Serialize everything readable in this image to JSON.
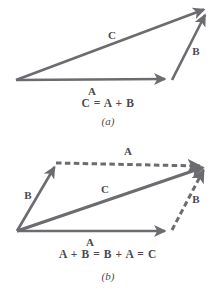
{
  "figure": {
    "stroke_color": "#6b6b70",
    "text_color": "#4a4a4f",
    "background_color": "#ffffff",
    "panels": [
      {
        "id": "panel-a",
        "caption": "(a)",
        "style": "triangle-rule",
        "equation": "C = A + B",
        "vectors": [
          {
            "name": "A",
            "label": "A",
            "line_style": "solid",
            "x1": 16,
            "y1": 80,
            "x2": 167,
            "y2": 79,
            "label_x": 92,
            "label_y": 92
          },
          {
            "name": "B",
            "label": "B",
            "line_style": "solid",
            "x1": 172,
            "y1": 80,
            "x2": 207,
            "y2": 11,
            "label_x": 196,
            "label_y": 52
          },
          {
            "name": "C",
            "label": "C",
            "line_style": "solid",
            "x1": 16,
            "y1": 80,
            "x2": 208,
            "y2": 8,
            "label_x": 112,
            "label_y": 36
          }
        ],
        "equation_x": 108,
        "equation_y": 104,
        "caption_x": 108,
        "caption_y": 122
      },
      {
        "id": "panel-b",
        "caption": "(b)",
        "style": "parallelogram-rule",
        "equation": "A + B = B + A = C",
        "vectors": [
          {
            "name": "A-bottom",
            "label": "A",
            "line_style": "solid",
            "x1": 17,
            "y1": 231,
            "x2": 167,
            "y2": 231,
            "label_x": 90,
            "label_y": 243
          },
          {
            "name": "B-left",
            "label": "B",
            "line_style": "solid",
            "x1": 17,
            "y1": 231,
            "x2": 56,
            "y2": 164,
            "label_x": 28,
            "label_y": 196
          },
          {
            "name": "A-top",
            "label": "A",
            "line_style": "dashed",
            "x1": 56,
            "y1": 163,
            "x2": 203,
            "y2": 166,
            "label_x": 128,
            "label_y": 152
          },
          {
            "name": "B-right",
            "label": "B",
            "line_style": "dashed",
            "x1": 172,
            "y1": 230,
            "x2": 205,
            "y2": 167,
            "label_x": 196,
            "label_y": 200
          },
          {
            "name": "C-diagonal",
            "label": "C",
            "line_style": "solid",
            "x1": 17,
            "y1": 231,
            "x2": 207,
            "y2": 166,
            "label_x": 105,
            "label_y": 190
          }
        ],
        "equation_x": 108,
        "equation_y": 255,
        "caption_x": 108,
        "caption_y": 277
      }
    ]
  }
}
